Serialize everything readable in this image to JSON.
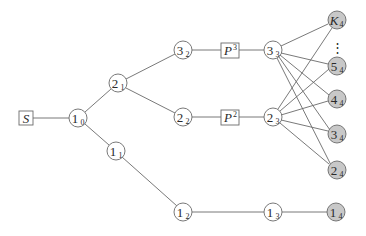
{
  "diagram": {
    "type": "layered-graph",
    "colors": {
      "edge": "#6a6a6a",
      "node_fill_white": "#ffffff",
      "node_fill_gray": "#c8c8c8",
      "text": "#2a2a2a"
    },
    "nodes": {
      "S": {
        "label": "S",
        "sub": "",
        "sup": "",
        "shape": "box"
      },
      "n10": {
        "label": "1",
        "sub": "0"
      },
      "n21": {
        "label": "2",
        "sub": "1"
      },
      "n11": {
        "label": "1",
        "sub": "1"
      },
      "n32": {
        "label": "3",
        "sub": "2"
      },
      "n22": {
        "label": "2",
        "sub": "2"
      },
      "n12": {
        "label": "1",
        "sub": "2"
      },
      "P3": {
        "label": "P",
        "sup": "3",
        "shape": "box"
      },
      "P2": {
        "label": "P",
        "sup": "2",
        "shape": "box"
      },
      "n33": {
        "label": "3",
        "sub": "3"
      },
      "n23": {
        "label": "2",
        "sub": "3"
      },
      "n13": {
        "label": "1",
        "sub": "3"
      },
      "K4": {
        "label": "K",
        "sub": "4",
        "shaded": true
      },
      "n54": {
        "label": "5",
        "sub": "4",
        "shaded": true
      },
      "n44": {
        "label": "4",
        "sub": "4",
        "shaded": true
      },
      "n34": {
        "label": "3",
        "sub": "4",
        "shaded": true
      },
      "n24": {
        "label": "2",
        "sub": "4",
        "shaded": true
      },
      "n14": {
        "label": "1",
        "sub": "4",
        "shaded": true
      }
    },
    "ellipsis": "⋮",
    "edges": [
      [
        "S",
        "1_0"
      ],
      [
        "1_0",
        "2_1"
      ],
      [
        "1_0",
        "1_1"
      ],
      [
        "2_1",
        "3_2"
      ],
      [
        "2_1",
        "2_2"
      ],
      [
        "1_1",
        "1_2"
      ],
      [
        "3_2",
        "P3"
      ],
      [
        "P3",
        "3_3"
      ],
      [
        "2_2",
        "P2"
      ],
      [
        "P2",
        "2_3"
      ],
      [
        "1_2",
        "1_3"
      ],
      [
        "1_3",
        "1_4"
      ],
      [
        "3_3",
        "K_4"
      ],
      [
        "3_3",
        "5_4"
      ],
      [
        "3_3",
        "4_4"
      ],
      [
        "3_3",
        "3_4"
      ],
      [
        "3_3",
        "2_4"
      ],
      [
        "2_3",
        "K_4"
      ],
      [
        "2_3",
        "5_4"
      ],
      [
        "2_3",
        "4_4"
      ],
      [
        "2_3",
        "3_4"
      ],
      [
        "2_3",
        "2_4"
      ]
    ]
  }
}
